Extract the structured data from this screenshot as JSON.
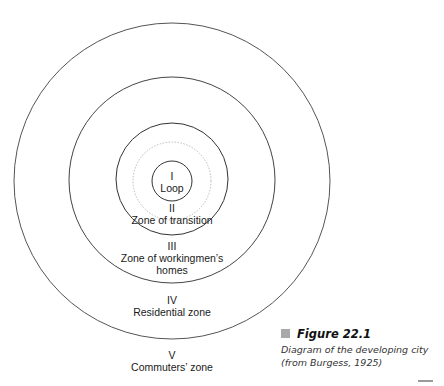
{
  "diagram": {
    "center": {
      "x": 172,
      "y": 181
    },
    "circles": [
      {
        "name": "zone-v-boundary",
        "r": 158,
        "stroke": "#555555",
        "dashed": false
      },
      {
        "name": "zone-iv-boundary",
        "r": 103,
        "stroke": "#444444",
        "dashed": false
      },
      {
        "name": "zone-iii-boundary",
        "r": 56,
        "stroke": "#333333",
        "dashed": false
      },
      {
        "name": "zone-ii-inner-dotted",
        "r": 39,
        "stroke": "#bbbbbb",
        "dashed": true
      },
      {
        "name": "zone-i-boundary",
        "r": 20,
        "stroke": "#333333",
        "dashed": false
      }
    ],
    "zones": [
      {
        "numeral": "I",
        "name": "Loop"
      },
      {
        "numeral": "II",
        "name": "Zone of transition"
      },
      {
        "numeral": "III",
        "name": "Zone of workingmen’s",
        "name2": "homes"
      },
      {
        "numeral": "IV",
        "name": "Residential zone"
      },
      {
        "numeral": "V",
        "name": "Commuters’ zone"
      }
    ]
  },
  "caption": {
    "title": "Figure 22.1",
    "line1": "Diagram of the developing city",
    "line2": "(from Burgess, 1925)",
    "square_color": "#a9a9a9"
  }
}
